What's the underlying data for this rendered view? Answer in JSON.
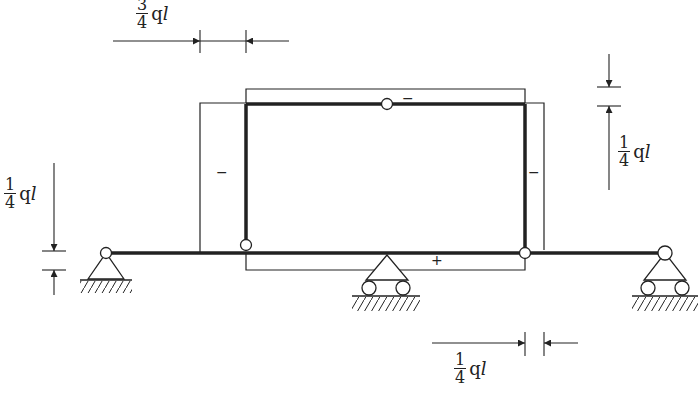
{
  "diagram": {
    "type": "axial force diagram of frame structure",
    "labels": {
      "top_force": {
        "numerator": "3",
        "denominator": "4",
        "unit": "q",
        "var": "l"
      },
      "left_force": {
        "numerator": "1",
        "denominator": "4",
        "unit": "q",
        "var": "l"
      },
      "right_force": {
        "numerator": "1",
        "denominator": "4",
        "unit": "q",
        "var": "l"
      },
      "bottom_force": {
        "numerator": "1",
        "denominator": "4",
        "unit": "q",
        "var": "l"
      }
    },
    "signs": {
      "top_member": "−",
      "left_column": "−",
      "right_column": "−",
      "bottom_member": "+"
    },
    "colors": {
      "line": "#222222",
      "background": "#ffffff"
    }
  }
}
